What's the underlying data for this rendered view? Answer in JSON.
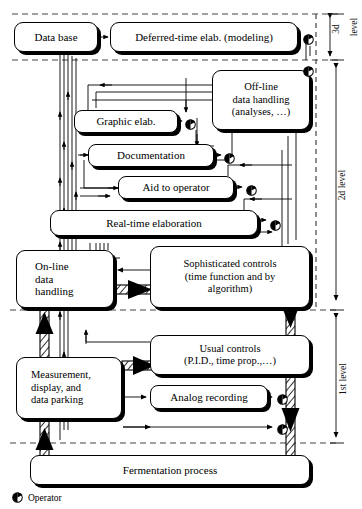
{
  "diagram": {
    "legend": {
      "icon": "operator-icon",
      "label": "Operator"
    },
    "levels": [
      {
        "id": "level3",
        "label": "3d",
        "label2": "level",
        "y_top": 14,
        "y_bottom": 60
      },
      {
        "id": "level2",
        "label": "2d level",
        "y_top": 60,
        "y_bottom": 310
      },
      {
        "id": "level1",
        "label": "1st level",
        "y_top": 310,
        "y_bottom": 443
      }
    ],
    "nodes": [
      {
        "id": "data-base",
        "label": "Data base",
        "x": 14,
        "y": 22,
        "w": 84,
        "h": 30,
        "lines": [
          "Data base"
        ]
      },
      {
        "id": "deferred-time",
        "label": "Deferred-time elab. (modeling)",
        "x": 110,
        "y": 22,
        "w": 188,
        "h": 30,
        "lines": [
          "Deferred-time elab. (modeling)"
        ]
      },
      {
        "id": "off-line",
        "label": "Off-line data handling (analyses, ...)",
        "x": 212,
        "y": 70,
        "w": 98,
        "h": 60,
        "lines": [
          "Off-line",
          "data handling",
          "(analyses, …)"
        ]
      },
      {
        "id": "graphic-elab",
        "label": "Graphic elab.",
        "x": 74,
        "y": 110,
        "w": 104,
        "h": 23,
        "lines": [
          "Graphic elab."
        ]
      },
      {
        "id": "documentation",
        "label": "Documentation",
        "x": 88,
        "y": 144,
        "w": 126,
        "h": 23,
        "lines": [
          "Documentation"
        ]
      },
      {
        "id": "aid-to-operator",
        "label": "Aid to operator",
        "x": 118,
        "y": 176,
        "w": 116,
        "h": 23,
        "lines": [
          "Aid to operator"
        ]
      },
      {
        "id": "real-time",
        "label": "Real-time elaboration",
        "x": 50,
        "y": 210,
        "w": 208,
        "h": 26,
        "lines": [
          "Real-time elaboration"
        ]
      },
      {
        "id": "on-line",
        "label": "On-line data handling",
        "x": 16,
        "y": 250,
        "w": 98,
        "h": 58,
        "lines": [
          "On-line",
          "data",
          "handling"
        ]
      },
      {
        "id": "sophisticated",
        "label": "Sophisticated controls (time function and by algorithm)",
        "x": 150,
        "y": 246,
        "w": 160,
        "h": 62,
        "lines": [
          "Sophisticated controls",
          "(time function and by",
          "algorithm)"
        ]
      },
      {
        "id": "usual-controls",
        "label": "Usual controls (P.I.D., time prop.,...)",
        "x": 150,
        "y": 335,
        "w": 160,
        "h": 40,
        "lines": [
          "Usual controls",
          "(P.I.D., time prop.,…)"
        ]
      },
      {
        "id": "measurement",
        "label": "Measurement, display, and data parking",
        "x": 16,
        "y": 357,
        "w": 106,
        "h": 62,
        "lines": [
          "Measurement,",
          "display, and",
          "data parking"
        ]
      },
      {
        "id": "analog-recording",
        "label": "Analog recording",
        "x": 150,
        "y": 385,
        "w": 118,
        "h": 24,
        "lines": [
          "Analog recording"
        ]
      },
      {
        "id": "fermentation",
        "label": "Fermentation process",
        "x": 30,
        "y": 455,
        "w": 280,
        "h": 30,
        "lines": [
          "Fermentation process"
        ]
      }
    ],
    "operator_markers": [
      {
        "id": "op-deferred",
        "x": 303,
        "y": 31
      },
      {
        "id": "op-offline",
        "x": 303,
        "y": 63
      },
      {
        "id": "op-graphic",
        "x": 185,
        "y": 116
      },
      {
        "id": "op-doc",
        "x": 224,
        "y": 150
      },
      {
        "id": "op-aid",
        "x": 246,
        "y": 182
      },
      {
        "id": "op-realtime",
        "x": 270,
        "y": 217
      },
      {
        "id": "op-analog",
        "x": 277,
        "y": 391
      },
      {
        "id": "op-direct",
        "x": 277,
        "y": 421
      }
    ],
    "colors": {
      "line": "#000000",
      "fill": "#ffffff",
      "shadow": "#000000",
      "dash": "#555555"
    }
  }
}
